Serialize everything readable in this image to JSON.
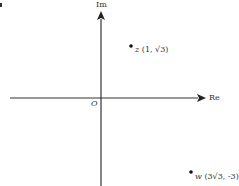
{
  "diagram": {
    "axes": {
      "real_label": "Re",
      "imag_label": "Im",
      "origin_label": "O"
    },
    "points": [
      {
        "name": "z",
        "coords": "(1, √3)",
        "label": "z",
        "coords_text": "(1, √3)"
      },
      {
        "name": "w",
        "coords": "(3√3, -3)",
        "label": "w",
        "coords_text": "(3√3, -3)"
      }
    ],
    "colors": {
      "axis": "#333333",
      "point": "#111111",
      "text": "#333333"
    }
  }
}
